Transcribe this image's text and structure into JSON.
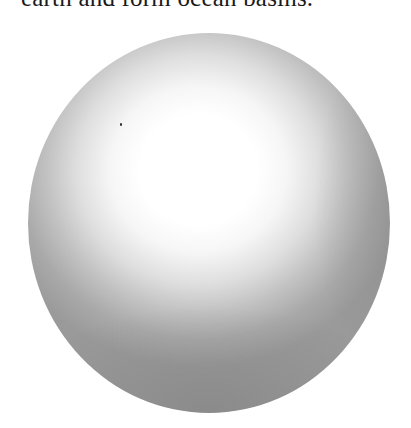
{
  "document": {
    "caption_fragment": "earth and form ocean basins."
  },
  "figure": {
    "type": "shaded-sphere-illustration",
    "colors": {
      "highlight": "#ffffff",
      "midtone": "#c2c2c2",
      "shadow": "#8a8a8a"
    }
  }
}
